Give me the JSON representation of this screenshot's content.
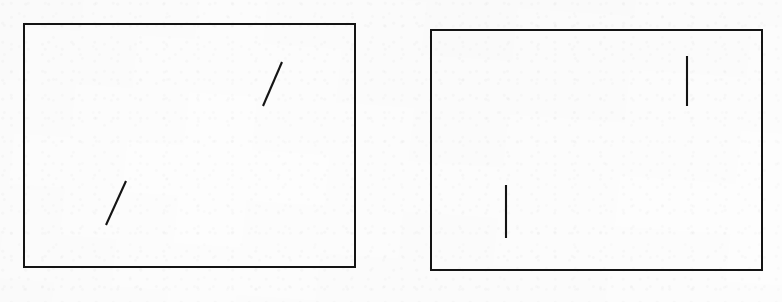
{
  "figure": {
    "title": "Two-panel line orientation stimulus",
    "background_color": "#fdfdfd",
    "ink_color": "#141414",
    "width": 782,
    "height": 302,
    "panel_count": 2
  },
  "panels": [
    {
      "id": "panel-left",
      "label": "Left stimulus panel",
      "frame": {
        "x": 23,
        "y": 23,
        "width": 333,
        "height": 245,
        "border_px": 2,
        "border_color": "#131313"
      },
      "segment_count": 2,
      "segments": [
        {
          "id": "left-panel-upper-segment",
          "label": "Upper right oblique segment",
          "orientation": "oblique",
          "tilt_degrees": 66,
          "x1": 240,
          "y1": 83,
          "x2": 259,
          "y2": 39,
          "length_px": 48,
          "stroke_color": "#141414",
          "stroke_width": 2.1
        },
        {
          "id": "left-panel-lower-segment",
          "label": "Lower left oblique segment",
          "orientation": "oblique",
          "tilt_degrees": 66,
          "x1": 83,
          "y1": 202,
          "x2": 103,
          "y2": 158,
          "length_px": 48,
          "stroke_color": "#141414",
          "stroke_width": 2.1
        }
      ]
    },
    {
      "id": "panel-right",
      "label": "Right stimulus panel",
      "frame": {
        "x": 430,
        "y": 29,
        "width": 333,
        "height": 242,
        "border_px": 2,
        "border_color": "#131313"
      },
      "segment_count": 2,
      "segments": [
        {
          "id": "right-panel-upper-segment",
          "label": "Upper right vertical segment",
          "orientation": "vertical",
          "tilt_degrees": 90,
          "x1": 257,
          "y1": 27,
          "x2": 257,
          "y2": 77,
          "length_px": 50,
          "stroke_color": "#141414",
          "stroke_width": 2.1
        },
        {
          "id": "right-panel-lower-segment",
          "label": "Lower left vertical segment",
          "orientation": "vertical",
          "tilt_degrees": 90,
          "x1": 76,
          "y1": 156,
          "x2": 76,
          "y2": 209,
          "length_px": 53,
          "stroke_color": "#141414",
          "stroke_width": 2.1
        }
      ]
    }
  ]
}
